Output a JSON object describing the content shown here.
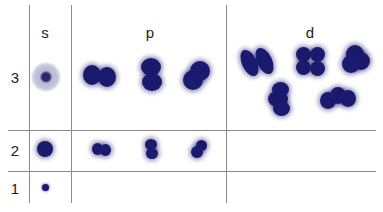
{
  "diagram": {
    "columns": [
      {
        "id": "s",
        "label": "s"
      },
      {
        "id": "p",
        "label": "p"
      },
      {
        "id": "d",
        "label": "d"
      }
    ],
    "rows": [
      {
        "n": "3",
        "label": "3",
        "orbitals": {
          "s": 1,
          "p": 3,
          "d": 5
        }
      },
      {
        "n": "2",
        "label": "2",
        "orbitals": {
          "s": 1,
          "p": 3,
          "d": 0
        }
      },
      {
        "n": "1",
        "label": "1",
        "orbitals": {
          "s": 1,
          "p": 0,
          "d": 0
        }
      }
    ],
    "colors": {
      "orbital": "#1a1a6e",
      "halo": "#c6c6dc",
      "grid": "#8a8a8a",
      "text": "#222222"
    }
  }
}
